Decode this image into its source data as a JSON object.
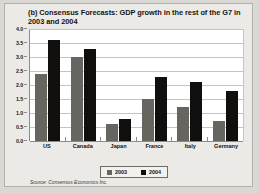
{
  "chart_data": {
    "type": "bar",
    "title": "(b) Consensus Forecasts: GDP growth in the rest of the G7 in 2003 and 2004",
    "categories": [
      "US",
      "Canada",
      "Japan",
      "France",
      "Italy",
      "Germany"
    ],
    "series": [
      {
        "name": "2003",
        "color": "#67655f",
        "values": [
          2.4,
          3.0,
          0.6,
          1.5,
          1.2,
          0.7
        ]
      },
      {
        "name": "2004",
        "color": "#100f0d",
        "values": [
          3.6,
          3.3,
          0.8,
          2.3,
          2.1,
          1.8
        ]
      }
    ],
    "xlabel": "",
    "ylabel": "",
    "ylim": [
      0.0,
      4.0
    ],
    "yticks": [
      "0.0",
      "0.5",
      "1.0",
      "1.5",
      "2.0",
      "2.5",
      "3.0",
      "3.5",
      "4.0"
    ],
    "grid": true,
    "legend_position": "bottom-center",
    "source": "Source: Consensus Economics Inc."
  }
}
